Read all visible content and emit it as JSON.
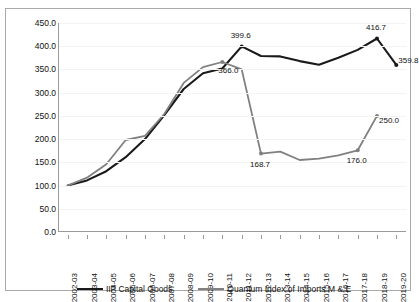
{
  "chart_data": {
    "type": "line",
    "title": "",
    "subtitle": "",
    "xlabel": "",
    "ylabel": "",
    "ylim": [
      0.0,
      450.0
    ],
    "ytick_step": 50.0,
    "ytick_labels": [
      "450.0",
      "400.0",
      "350.0",
      "300.0",
      "250.0",
      "200.0",
      "150.0",
      "100.0",
      "50.0",
      "0.0"
    ],
    "grid": true,
    "legend_position": "bottom",
    "categories": [
      "2002-03",
      "2003-04",
      "2004-05",
      "2005-06",
      "2006-07",
      "2007-08",
      "2008-09",
      "2009-10",
      "2010-11",
      "2011-12",
      "2012-13",
      "2013-14",
      "2014-15",
      "2015-16",
      "2016-17",
      "2017-18",
      "2018-19",
      "2019-20"
    ],
    "series": [
      {
        "name": "IIP Capital Goods",
        "color": "#1a1a1a",
        "markers": true,
        "values": [
          100.0,
          111.0,
          131.0,
          161.0,
          200.0,
          252.0,
          308.0,
          342.0,
          352.0,
          399.6,
          379.0,
          378.0,
          368.0,
          360.0,
          375.0,
          392.0,
          416.7,
          359.8
        ]
      },
      {
        "name": "Quantum Index of Imports M & E",
        "color": "#808080",
        "markers": true,
        "values": [
          100.0,
          117.0,
          146.0,
          198.0,
          207.0,
          254.0,
          321.0,
          355.0,
          366.0,
          350.0,
          168.7,
          173.0,
          155.0,
          158.0,
          165.0,
          176.0,
          250.0,
          null
        ]
      }
    ],
    "annotations": [
      {
        "series": "IIP Capital Goods",
        "category": "2011-12",
        "label": "399.6"
      },
      {
        "series": "IIP Capital Goods",
        "category": "2018-19",
        "label": "416.7"
      },
      {
        "series": "IIP Capital Goods",
        "category": "2019-20",
        "label": "359.8"
      },
      {
        "series": "Quantum Index of Imports M & E",
        "category": "2010-11",
        "label": "366.0"
      },
      {
        "series": "Quantum Index of Imports M & E",
        "category": "2012-13",
        "label": "168.7"
      },
      {
        "series": "Quantum Index of Imports M & E",
        "category": "2017-18",
        "label": "176.0"
      },
      {
        "series": "Quantum Index of Imports M & E",
        "category": "2018-19",
        "label": "250.0"
      }
    ]
  },
  "legend": {
    "items": [
      {
        "label": "IIP Capital Goods",
        "color": "#1a1a1a"
      },
      {
        "label": "Quantum Index of Imports M & E",
        "color": "#808080"
      }
    ]
  }
}
